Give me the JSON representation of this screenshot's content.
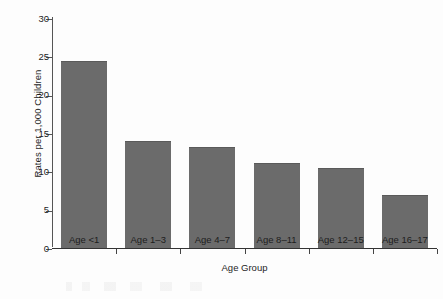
{
  "chart_data": {
    "type": "bar",
    "title": "",
    "subtitle": "",
    "xlabel": "Age Group",
    "ylabel": "Rates per 1,000 Children",
    "categories": [
      "Age <1",
      "Age 1–3",
      "Age 4–7",
      "Age 8–11",
      "Age 12–15",
      "Age 16–17"
    ],
    "values": [
      24.4,
      13.9,
      13.2,
      11.1,
      10.5,
      6.9
    ],
    "ylim": [
      0,
      30
    ],
    "ytick_labels": [
      "0",
      "5",
      "10",
      "15",
      "20",
      "25",
      "30"
    ],
    "ytick_values": [
      0,
      5,
      10,
      15,
      20,
      25,
      30
    ],
    "grid": false,
    "legend": null,
    "legend_position": "none",
    "bar_color": "#6b6b6b",
    "axis_color": "#333333",
    "background_color": "#fdfdfd"
  }
}
